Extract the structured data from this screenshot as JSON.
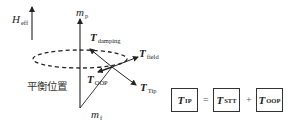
{
  "diagram": {
    "labels": {
      "h_eff": {
        "main": "H",
        "sub": "eff"
      },
      "m_p": {
        "main": "m",
        "sub": "p"
      },
      "m_f": {
        "main": "m",
        "sub": "f"
      },
      "t_damping": {
        "main": "T",
        "sub": "damping"
      },
      "t_field": {
        "main": "T",
        "sub": "field"
      },
      "t_tip": {
        "main": "T",
        "sub": "Tip"
      },
      "t_oop": {
        "main": "T",
        "sub": "OOP"
      },
      "equilibrium": "平衡位置"
    },
    "equation": {
      "lhs": {
        "main": "T",
        "sub": "IP"
      },
      "equals": "=",
      "term1": {
        "main": "T",
        "sub": "STT"
      },
      "plus": "+",
      "term2": {
        "main": "T",
        "sub": "OOP"
      }
    },
    "colors": {
      "stroke": "#222222",
      "box_border": "#333333"
    }
  }
}
